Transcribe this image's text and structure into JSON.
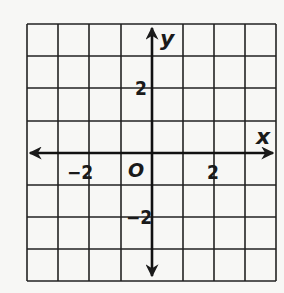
{
  "diagram": {
    "type": "coordinate-plane",
    "grid": {
      "x_min": -4,
      "x_max": 4,
      "y_min": -4,
      "y_max": 4,
      "step": 1,
      "cells_x": 8,
      "cells_y": 8
    },
    "axes": {
      "x_label": "x",
      "y_label": "y",
      "origin_label": "O",
      "arrows": "both-directions"
    },
    "tick_labels": {
      "x_neg2": "−2",
      "x_pos2": "2",
      "y_pos2": "2",
      "y_neg2": "−2"
    },
    "colors": {
      "background": "#f7f7f5",
      "ink": "#1a1a1a"
    }
  }
}
